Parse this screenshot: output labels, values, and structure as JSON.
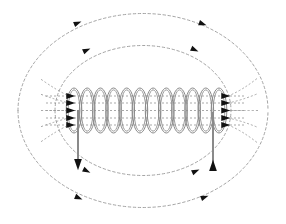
{
  "figure": {
    "type": "physics-field-diagram",
    "background_color": "#ffffff",
    "width": 286,
    "height": 224
  },
  "colors": {
    "coil_stroke": "#8a8a8a",
    "lead_wire_stroke": "#8a8a8a",
    "field_line_stroke": "#9a9a9a",
    "arrowhead_fill": "#111111",
    "background": "#ffffff"
  },
  "solenoid": {
    "label": "solenoid-coil",
    "turns": 12,
    "x_start": 74,
    "x_end": 219,
    "center_y": 110.5,
    "turn_half_width": 7.8,
    "turn_half_height": 22.5,
    "stroke_width": 1.0,
    "inner_offset": 1.9
  },
  "leads": [
    {
      "name": "left-lead-wire",
      "direction": "down",
      "x": 78,
      "y_top": 110,
      "y_bottom": 165,
      "arrow_label": "current-down"
    },
    {
      "name": "right-lead-wire",
      "direction": "up",
      "x": 213,
      "y_top": 112,
      "y_bottom": 167,
      "arrow_label": "current-up"
    }
  ],
  "interior_field_lines": {
    "label": "axial-field-lines",
    "count": 5,
    "y_values": [
      96,
      103,
      110.5,
      118,
      125
    ],
    "x_left": 46,
    "x_right": 246,
    "dash": "2,2",
    "direction": "left-to-right"
  },
  "entry_arrows": {
    "label": "field-entry-arrows-left",
    "count": 5,
    "x": 71,
    "y_values": [
      96,
      103,
      110.5,
      118,
      125
    ],
    "direction": "right"
  },
  "exit_arrows": {
    "label": "field-exit-arrows-right",
    "count": 5,
    "x": 226,
    "y_values": [
      96,
      103,
      110.5,
      118,
      125
    ],
    "direction": "right"
  },
  "field_loops": [
    {
      "name": "outer-top-loop",
      "position": "top",
      "rank": "outer",
      "cx": 143,
      "cy": 110.5,
      "rx": 125,
      "ry": 97,
      "dash": "2.5,2.5",
      "arrowheads": [
        {
          "name": "loop-arrow-outer-top-left",
          "x": 78,
          "y": 23,
          "angle": -22
        },
        {
          "name": "loop-arrow-outer-top-right",
          "x": 203,
          "y": 24,
          "angle": 20
        }
      ]
    },
    {
      "name": "inner-top-loop",
      "position": "top",
      "rank": "inner",
      "cx": 143,
      "cy": 110.5,
      "rx": 88,
      "ry": 65,
      "dash": "2.5,2.5",
      "arrowheads": [
        {
          "name": "loop-arrow-inner-top-left",
          "x": 87,
          "y": 50,
          "angle": -25
        },
        {
          "name": "loop-arrow-inner-top-right",
          "x": 195,
          "y": 50,
          "angle": 24
        }
      ]
    },
    {
      "name": "inner-bottom-loop",
      "position": "bottom",
      "rank": "inner",
      "cx": 143,
      "cy": 110.5,
      "rx": 88,
      "ry": 65,
      "dash": "2.5,2.5",
      "arrowheads": [
        {
          "name": "loop-arrow-inner-bottom-left",
          "x": 87,
          "y": 171,
          "angle": 26
        },
        {
          "name": "loop-arrow-inner-bottom-right",
          "x": 196,
          "y": 171,
          "angle": -24
        }
      ]
    },
    {
      "name": "outer-bottom-loop",
      "position": "bottom",
      "rank": "outer",
      "cx": 143,
      "cy": 110.5,
      "rx": 125,
      "ry": 97,
      "dash": "2.5,2.5",
      "arrowheads": [
        {
          "name": "loop-arrow-outer-bottom-left",
          "x": 79,
          "y": 198,
          "angle": 23
        },
        {
          "name": "loop-arrow-outer-bottom-right",
          "x": 205,
          "y": 197,
          "angle": -21
        }
      ]
    }
  ]
}
